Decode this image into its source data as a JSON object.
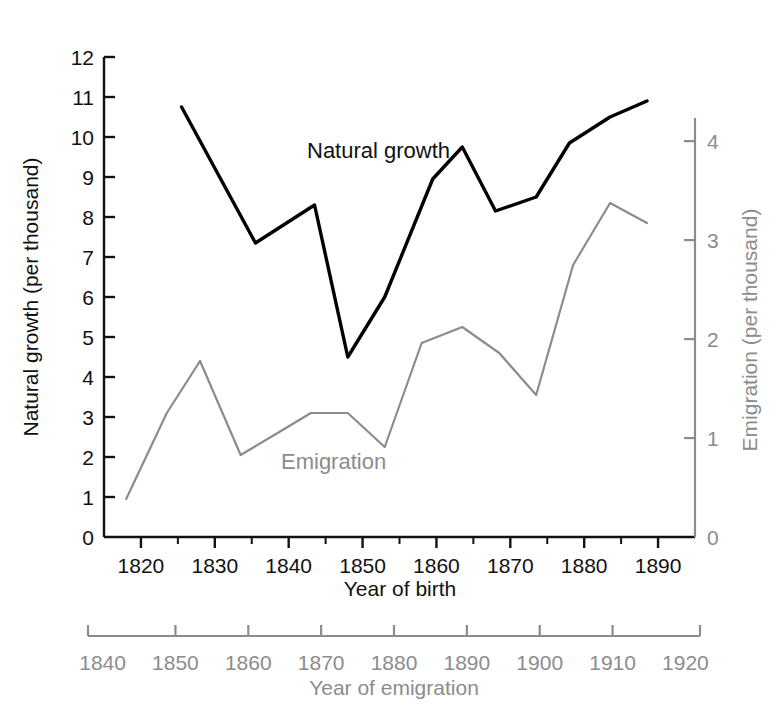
{
  "chart_data": {
    "type": "line",
    "title": "",
    "xlabel": "Year of birth",
    "ylabel": "Natural growth (per thousand)",
    "secondary_xlabel": "Year of emigration",
    "secondary_ylabel": "Emigration (per thousand)",
    "grid": false,
    "legend_position": "inline-annotation",
    "xlim": [
      1815,
      1895
    ],
    "ylim": [
      0,
      12
    ],
    "y2lim": [
      0,
      4.85
    ],
    "x2lim": [
      1838,
      1922
    ],
    "x_ticks_major": [
      1820,
      1830,
      1840,
      1850,
      1860,
      1870,
      1880,
      1890
    ],
    "x_ticks_minor": [
      1825,
      1835,
      1845,
      1855,
      1865,
      1875,
      1885
    ],
    "x_tick_labels": [
      "1820",
      "1830",
      "1840",
      "1850",
      "1860",
      "1870",
      "1880",
      "1890"
    ],
    "y_ticks": [
      0,
      1,
      2,
      3,
      4,
      5,
      6,
      7,
      8,
      9,
      10,
      11,
      12
    ],
    "y_tick_labels": [
      "0",
      "1",
      "2",
      "3",
      "4",
      "5",
      "6",
      "7",
      "8",
      "9",
      "10",
      "11",
      "12"
    ],
    "y2_ticks": [
      0,
      1,
      2,
      3,
      4
    ],
    "y2_tick_labels": [
      "0",
      "1",
      "2",
      "3",
      "4"
    ],
    "x2_ticks": [
      1840,
      1850,
      1860,
      1870,
      1880,
      1890,
      1900,
      1910,
      1920
    ],
    "x2_tick_labels": [
      "1840",
      "1850",
      "1860",
      "1870",
      "1880",
      "1890",
      "1900",
      "1910",
      "1920"
    ],
    "series": [
      {
        "name": "Natural growth",
        "color": "#000000",
        "axis": "left",
        "label_text": "Natural growth",
        "x": [
          1825.5,
          1835.5,
          1843.5,
          1848,
          1853,
          1859.5,
          1863.5,
          1868,
          1873.5,
          1878,
          1883.5,
          1888.5
        ],
        "values": [
          10.75,
          7.35,
          8.3,
          4.5,
          6.0,
          8.95,
          9.75,
          8.15,
          8.5,
          9.85,
          10.5,
          10.9
        ]
      },
      {
        "name": "Emigration",
        "color": "#8c8c8c",
        "axis": "right",
        "label_text": "Emigration",
        "x": [
          1818,
          1823.5,
          1828,
          1833.5,
          1838.5,
          1843,
          1848,
          1853,
          1858,
          1863.5,
          1868.5,
          1873.5,
          1878.5,
          1883.5,
          1888.5
        ],
        "values_left_scale": [
          0.95,
          3.1,
          4.4,
          2.05,
          2.6,
          3.1,
          3.1,
          2.25,
          4.85,
          5.25,
          4.6,
          3.55,
          6.8,
          8.35,
          7.85
        ],
        "values": [
          0.39,
          1.27,
          1.8,
          0.84,
          1.06,
          1.27,
          1.27,
          0.92,
          1.98,
          2.15,
          1.88,
          1.45,
          2.78,
          3.42,
          3.21
        ]
      }
    ]
  }
}
